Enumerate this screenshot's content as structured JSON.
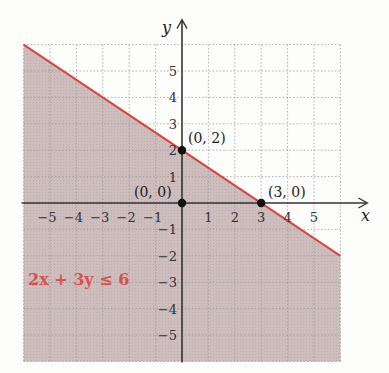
{
  "chart_data": {
    "type": "line",
    "title": "",
    "xlabel": "x",
    "ylabel": "y",
    "xlim": [
      -6,
      6
    ],
    "ylim": [
      -6,
      6
    ],
    "grid": true,
    "x_ticks": [
      -5,
      -4,
      -3,
      -2,
      -1,
      1,
      2,
      3,
      4,
      5
    ],
    "y_ticks": [
      5,
      4,
      3,
      2,
      1,
      -1,
      -2,
      -3,
      -4,
      -5
    ],
    "x_tick_labels": [
      "−5",
      "−4",
      "−3",
      "−2",
      "−1",
      "1",
      "2",
      "3",
      "4",
      "5"
    ],
    "y_tick_labels": [
      "5",
      "4",
      "3",
      "2",
      "1",
      "−1",
      "−2",
      "−3",
      "−4",
      "−5"
    ],
    "boundary_line": {
      "equation": "2x + 3y = 6",
      "x": [
        -6,
        6
      ],
      "y": [
        6,
        -2
      ],
      "color": "#d9473f"
    },
    "shaded_region": {
      "inequality": "2x + 3y ≤ 6",
      "side": "below",
      "color": "#c9b8b8"
    },
    "points": [
      {
        "x": 0,
        "y": 2,
        "label": "(0, 2)"
      },
      {
        "x": 0,
        "y": 0,
        "label": "(0, 0)"
      },
      {
        "x": 3,
        "y": 0,
        "label": "(3, 0)"
      }
    ],
    "annotations": [
      {
        "text": "2x + 3y ≤ 6",
        "x": -5.7,
        "y": -3
      }
    ]
  },
  "labels": {
    "x_axis": "x",
    "y_axis": "y",
    "inequality": "2x + 3y ≤ 6",
    "p02": "(0, 2)",
    "p00": "(0, 0)",
    "p30": "(3, 0)"
  }
}
